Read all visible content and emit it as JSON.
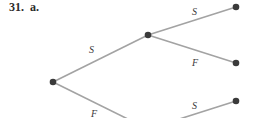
{
  "heading": "31.  a.",
  "tree": {
    "nodes": [
      {
        "id": "root",
        "x": 53,
        "y": 82
      },
      {
        "id": "mid-S",
        "x": 148,
        "y": 35
      },
      {
        "id": "mid-F",
        "x": 148,
        "y": 129
      },
      {
        "id": "leaf-SS",
        "x": 236,
        "y": 7
      },
      {
        "id": "leaf-SF",
        "x": 236,
        "y": 63
      },
      {
        "id": "leaf-FS",
        "x": 236,
        "y": 101
      }
    ],
    "edges": [
      {
        "from": "root",
        "to": "mid-S",
        "label": "S"
      },
      {
        "from": "root",
        "to": "mid-F",
        "label": "F"
      },
      {
        "from": "mid-S",
        "to": "leaf-SS",
        "label": "S"
      },
      {
        "from": "mid-S",
        "to": "leaf-SF",
        "label": "F"
      },
      {
        "from": "mid-F",
        "to": "leaf-FS",
        "label": "S"
      }
    ],
    "labels": {
      "root_to_S": "S",
      "root_to_F": "F",
      "S_to_S": "S",
      "S_to_F": "F",
      "F_to_S": "S"
    }
  }
}
